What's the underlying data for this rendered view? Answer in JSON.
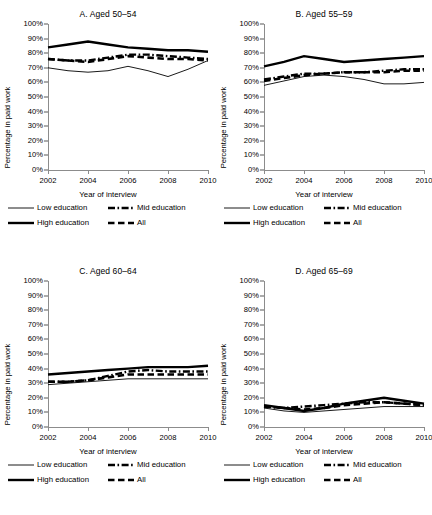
{
  "axes": {
    "ylabel": "Percentage in paid work",
    "xlabel": "Year of interview",
    "yticks": [
      "100%",
      "90%",
      "80%",
      "70%",
      "60%",
      "50%",
      "40%",
      "30%",
      "20%",
      "10%",
      "0%"
    ],
    "xticks": [
      "2002",
      "2004",
      "2006",
      "2008",
      "2010"
    ]
  },
  "legend": {
    "low": "Low education",
    "mid": "Mid education",
    "high": "High education",
    "all": "All"
  },
  "panels": [
    {
      "title": "A.  Aged 50–54"
    },
    {
      "title": "B.  Aged 55–59"
    },
    {
      "title": "C.  Aged 60–64"
    },
    {
      "title": "D.  Aged 65–69"
    }
  ],
  "chart_data": [
    {
      "type": "line",
      "title": "A.  Aged 50–54",
      "xlabel": "Year of interview",
      "ylabel": "Percentage in paid work",
      "x": [
        2002,
        2003,
        2004,
        2005,
        2006,
        2007,
        2008,
        2009,
        2010
      ],
      "xlim": [
        2002,
        2010
      ],
      "ylim": [
        0,
        100
      ],
      "ytick_step": 10,
      "grid": false,
      "legend_position": "below",
      "series": [
        {
          "name": "Low education",
          "style": "thin-solid",
          "values": [
            70,
            68,
            67,
            68,
            71,
            68,
            64,
            69,
            75
          ]
        },
        {
          "name": "Mid education",
          "style": "dash-dot",
          "values": [
            76,
            75,
            75,
            77,
            79,
            79,
            78,
            77,
            76
          ]
        },
        {
          "name": "High education",
          "style": "thick-solid",
          "values": [
            84,
            86,
            88,
            86,
            84,
            83,
            82,
            82,
            81
          ]
        },
        {
          "name": "All",
          "style": "thick-dash",
          "values": [
            76,
            75,
            74,
            76,
            78,
            77,
            76,
            76,
            75
          ]
        }
      ]
    },
    {
      "type": "line",
      "title": "B.  Aged 55–59",
      "xlabel": "Year of interview",
      "ylabel": "Percentage in paid work",
      "x": [
        2002,
        2003,
        2004,
        2005,
        2006,
        2007,
        2008,
        2009,
        2010
      ],
      "xlim": [
        2002,
        2010
      ],
      "ylim": [
        0,
        100
      ],
      "ytick_step": 10,
      "grid": false,
      "legend_position": "below",
      "series": [
        {
          "name": "Low education",
          "style": "thin-solid",
          "values": [
            58,
            61,
            64,
            65,
            64,
            62,
            59,
            59,
            60
          ]
        },
        {
          "name": "Mid education",
          "style": "dash-dot",
          "values": [
            62,
            64,
            66,
            66,
            67,
            67,
            68,
            69,
            69
          ]
        },
        {
          "name": "High education",
          "style": "thick-solid",
          "values": [
            71,
            74,
            78,
            76,
            74,
            75,
            76,
            77,
            78
          ]
        },
        {
          "name": "All",
          "style": "thick-dash",
          "values": [
            61,
            63,
            65,
            66,
            67,
            67,
            67,
            68,
            68
          ]
        }
      ]
    },
    {
      "type": "line",
      "title": "C.  Aged 60–64",
      "xlabel": "Year of interview",
      "ylabel": "Percentage in paid work",
      "x": [
        2002,
        2003,
        2004,
        2005,
        2006,
        2007,
        2008,
        2009,
        2010
      ],
      "xlim": [
        2002,
        2010
      ],
      "ylim": [
        0,
        100
      ],
      "ytick_step": 10,
      "grid": false,
      "legend_position": "below",
      "series": [
        {
          "name": "Low education",
          "style": "thin-solid",
          "values": [
            29,
            30,
            31,
            32,
            33,
            33,
            33,
            33,
            33
          ]
        },
        {
          "name": "Mid education",
          "style": "dash-dot",
          "values": [
            31,
            31,
            32,
            35,
            38,
            39,
            38,
            38,
            38
          ]
        },
        {
          "name": "High education",
          "style": "thick-solid",
          "values": [
            36,
            37,
            38,
            39,
            40,
            41,
            41,
            41,
            42
          ]
        },
        {
          "name": "All",
          "style": "thick-dash",
          "values": [
            31,
            31,
            32,
            34,
            36,
            36,
            36,
            36,
            36
          ]
        }
      ]
    },
    {
      "type": "line",
      "title": "D.  Aged 65–69",
      "xlabel": "Year of interview",
      "ylabel": "Percentage in paid work",
      "x": [
        2002,
        2003,
        2004,
        2005,
        2006,
        2007,
        2008,
        2009,
        2010
      ],
      "xlim": [
        2002,
        2010
      ],
      "ylim": [
        0,
        100
      ],
      "ytick_step": 10,
      "grid": false,
      "legend_position": "below",
      "series": [
        {
          "name": "Low education",
          "style": "thin-solid",
          "values": [
            13,
            11,
            10,
            11,
            12,
            13,
            14,
            14,
            14
          ]
        },
        {
          "name": "Mid education",
          "style": "dash-dot",
          "values": [
            14,
            13,
            14,
            15,
            16,
            17,
            17,
            16,
            15
          ]
        },
        {
          "name": "High education",
          "style": "thick-solid",
          "values": [
            15,
            13,
            11,
            13,
            16,
            18,
            20,
            18,
            16
          ]
        },
        {
          "name": "All",
          "style": "thick-dash",
          "values": [
            14,
            13,
            12,
            13,
            15,
            16,
            17,
            16,
            15
          ]
        }
      ]
    }
  ]
}
